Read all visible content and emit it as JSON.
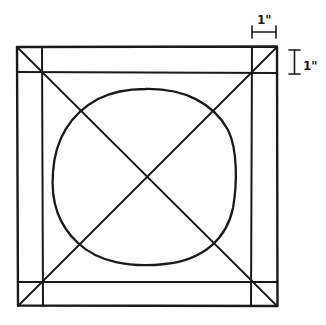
{
  "diagram": {
    "colors": {
      "stroke": "#1a1a1a",
      "background": "#ffffff"
    },
    "outer_square": {
      "x1": 17,
      "y1": 47,
      "x2": 277,
      "y2": 306
    },
    "inner_lines": {
      "left_x": 42,
      "right_x": 252,
      "top_y": 72,
      "bottom_y": 282
    },
    "circle": {
      "cx": 144,
      "cy": 177,
      "rx": 92,
      "ry": 88
    },
    "diagonals": [
      {
        "from": "top-left",
        "to": "bottom-right"
      },
      {
        "from": "top-right",
        "to": "bottom-left"
      }
    ],
    "dimensions": {
      "horizontal": {
        "label": "1\"",
        "x1": 252,
        "x2": 277,
        "y": 32
      },
      "vertical": {
        "label": "1\"",
        "y1": 50,
        "y2": 74,
        "x": 294
      }
    }
  }
}
